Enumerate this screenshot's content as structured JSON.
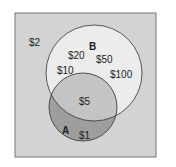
{
  "diagram": {
    "type": "venn",
    "universe_label": "$2",
    "set_b": {
      "name": "B",
      "items": [
        "$20",
        "$50",
        "$10",
        "$100"
      ]
    },
    "set_a": {
      "name": "A",
      "items": [
        "$1"
      ]
    },
    "intersection": {
      "items": [
        "$5"
      ]
    },
    "colors": {
      "background": "#d3d3d3",
      "b_fill": "#ececec",
      "intersection_fill": "#c4c4c4",
      "a_only_fill": "#9e9e9e",
      "stroke": "#333333"
    }
  }
}
